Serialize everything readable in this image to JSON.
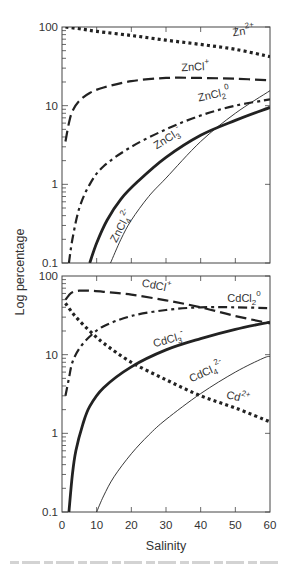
{
  "chart_data": [
    {
      "type": "line",
      "panel": "top",
      "title": "",
      "xlabel": "Salinity",
      "ylabel": "Log percentage",
      "yscale": "log",
      "xlim": [
        0,
        60
      ],
      "ylim": [
        0.1,
        100
      ],
      "xticks": [
        0,
        10,
        20,
        30,
        40,
        50,
        60
      ],
      "yticks": [
        0.1,
        1,
        10,
        100
      ],
      "ytick_labels": [
        "0.1",
        "1",
        "10",
        "100"
      ],
      "grid": false,
      "legend": "inline labels",
      "series": [
        {
          "name": "Zn2+",
          "label_main": "Zn",
          "label_sup": "2+",
          "label_sub": "",
          "style": "dotted",
          "width": 3.2,
          "x": [
            1,
            5,
            10,
            20,
            30,
            40,
            50,
            60
          ],
          "y": [
            100,
            95,
            88,
            78,
            68,
            60,
            52,
            42
          ]
        },
        {
          "name": "ZnCl+",
          "label_main": "ZnCl",
          "label_sup": "+",
          "label_sub": "",
          "style": "dashed-long",
          "width": 2.2,
          "x": [
            1,
            2,
            3,
            5,
            8,
            12,
            20,
            30,
            40,
            50,
            60
          ],
          "y": [
            3.5,
            6,
            8.5,
            11.5,
            14.5,
            17,
            20.5,
            22.5,
            22.5,
            22,
            21
          ]
        },
        {
          "name": "ZnCl2 0",
          "label_main": "ZnCl",
          "label_sup": "0",
          "label_sub": "2",
          "style": "dash-dot",
          "width": 2.2,
          "x": [
            2,
            3,
            5,
            8,
            12,
            20,
            30,
            40,
            50,
            60
          ],
          "y": [
            0.1,
            0.2,
            0.5,
            1,
            1.7,
            3,
            5,
            7.5,
            10,
            12
          ]
        },
        {
          "name": "ZnCl3-",
          "label_main": "ZnCl",
          "label_sup": "-",
          "label_sub": "3",
          "style": "solid-thick",
          "width": 2.8,
          "x": [
            8,
            10,
            13,
            17,
            22,
            30,
            40,
            50,
            60
          ],
          "y": [
            0.1,
            0.18,
            0.35,
            0.65,
            1.1,
            2.2,
            4.2,
            6.5,
            9.5
          ]
        },
        {
          "name": "ZnCl4 2-",
          "label_main": "ZnCl",
          "label_sup": "2-",
          "label_sub": "4",
          "style": "solid-thin",
          "width": 0.9,
          "x": [
            14,
            17,
            20,
            25,
            30,
            40,
            50,
            60
          ],
          "y": [
            0.1,
            0.2,
            0.35,
            0.7,
            1.2,
            3.5,
            8,
            15.5
          ]
        }
      ]
    },
    {
      "type": "line",
      "panel": "bottom",
      "title": "",
      "xlabel": "Salinity",
      "ylabel": "Log percentage",
      "yscale": "log",
      "xlim": [
        0,
        60
      ],
      "ylim": [
        0.1,
        100
      ],
      "xticks": [
        0,
        10,
        20,
        30,
        40,
        50,
        60
      ],
      "xtick_labels": [
        "0",
        "10",
        "20",
        "30",
        "40",
        "50",
        "60"
      ],
      "yticks": [
        0.1,
        1,
        10,
        100
      ],
      "ytick_labels": [
        "0.1",
        "1",
        "10",
        "100"
      ],
      "grid": false,
      "legend": "inline labels",
      "series": [
        {
          "name": "CdCl+",
          "label_main": "CdCl",
          "label_sup": "+",
          "label_sub": "",
          "style": "dashed-long",
          "width": 2.2,
          "x": [
            1,
            2,
            3,
            5,
            8,
            12,
            20,
            30,
            40,
            50,
            60
          ],
          "y": [
            50,
            57,
            62,
            65,
            65,
            63,
            58,
            49,
            40,
            31,
            25
          ]
        },
        {
          "name": "CdCl2 0",
          "label_main": "CdCl",
          "label_sup": "0",
          "label_sub": "2",
          "style": "dash-dot",
          "width": 2.2,
          "x": [
            1,
            2,
            3,
            5,
            8,
            12,
            20,
            30,
            40,
            50,
            60
          ],
          "y": [
            3,
            5,
            8,
            12,
            17,
            23,
            31,
            37,
            40,
            40,
            39
          ]
        },
        {
          "name": "CdCl3-",
          "label_main": "CdCl",
          "label_sup": "-",
          "label_sub": "3",
          "style": "solid-thick",
          "width": 2.8,
          "x": [
            2,
            3,
            4,
            6,
            8,
            12,
            20,
            30,
            40,
            50,
            60
          ],
          "y": [
            0.1,
            0.3,
            0.6,
            1.3,
            2.2,
            3.8,
            7,
            11.5,
            16,
            21,
            26
          ]
        },
        {
          "name": "CdCl4 2-",
          "label_main": "CdCl",
          "label_sup": "2-",
          "label_sub": "4",
          "style": "solid-thin",
          "width": 0.9,
          "x": [
            10,
            12,
            15,
            20,
            25,
            30,
            40,
            50,
            58,
            60
          ],
          "y": [
            0.1,
            0.16,
            0.28,
            0.55,
            0.95,
            1.5,
            3.2,
            6,
            9,
            9.5
          ]
        },
        {
          "name": "Cd2+",
          "label_main": "Cd",
          "label_sup": "2+",
          "label_sub": "",
          "style": "dotted",
          "width": 3.2,
          "x": [
            1,
            3,
            5,
            8,
            12,
            20,
            30,
            40,
            50,
            60
          ],
          "y": [
            45,
            34,
            27,
            20,
            14,
            8,
            4.8,
            3,
            2.1,
            1.4
          ]
        }
      ]
    }
  ],
  "labels": {
    "top": [
      {
        "series": "Zn2+",
        "x": 52.5,
        "y": 80,
        "angle": -8
      },
      {
        "series": "ZnCl+",
        "x": 38.5,
        "y": 28,
        "angle": -3
      },
      {
        "series": "ZnCl2 0",
        "x": 44,
        "y": 12.5,
        "angle": -12
      },
      {
        "series": "ZnCl3-",
        "x": 31,
        "y": 3.5,
        "angle": -32
      },
      {
        "series": "ZnCl4 2-",
        "x": 18,
        "y": 0.28,
        "angle": -62
      }
    ],
    "bottom": [
      {
        "series": "CdCl+",
        "x": 27,
        "y": 68,
        "angle": 12
      },
      {
        "series": "CdCl2 0",
        "x": 52.5,
        "y": 47,
        "angle": 0
      },
      {
        "series": "CdCl3-",
        "x": 31,
        "y": 14,
        "angle": -15
      },
      {
        "series": "CdCl4 2-",
        "x": 42,
        "y": 5.5,
        "angle": -24
      },
      {
        "series": "Cd2+",
        "x": 50.5,
        "y": 2.6,
        "angle": 14
      }
    ]
  },
  "axes": {
    "ylabel": "Log percentage",
    "xlabel": "Salinity"
  },
  "colors": {
    "ink": "#222222",
    "axis": "#444444",
    "text": "#333333"
  }
}
